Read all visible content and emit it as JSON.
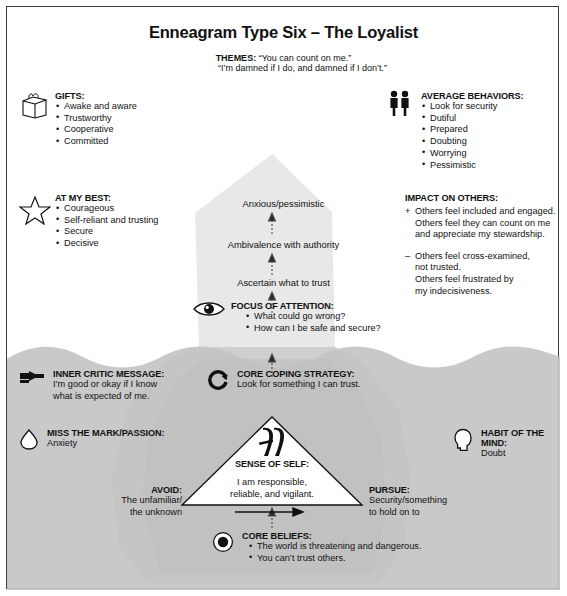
{
  "title": "Enneagram Type Six – The Loyalist",
  "themes": {
    "label": "THEMES:",
    "line1": "“You can count on me.”",
    "line2": "“I’m damned if I do, and damned if I don’t.”"
  },
  "gifts": {
    "icon": "gift-box-icon",
    "heading": "GIFTS:",
    "items": [
      "Awake and aware",
      "Trustworthy",
      "Cooperative",
      "Committed"
    ]
  },
  "at_my_best": {
    "icon": "star-icon",
    "heading": "AT MY BEST:",
    "items": [
      "Courageous",
      "Self-reliant and trusting",
      "Secure",
      "Decisive"
    ]
  },
  "average_behaviors": {
    "icon": "two-people-icon",
    "heading": "AVERAGE BEHAVIORS:",
    "items": [
      "Look for security",
      "Dutiful",
      "Prepared",
      "Doubting",
      "Worrying",
      "Pessimistic"
    ]
  },
  "impact_on_others": {
    "heading": "IMPACT ON OTHERS:",
    "positive": {
      "sign": "+",
      "lines": [
        "Others feel included and engaged.",
        "Others feel they can count on me",
        "and appreciate my stewardship."
      ]
    },
    "negative": {
      "sign": "–",
      "lines": [
        "Others feel cross-examined,",
        "not trusted.",
        "Others feel frustrated by",
        "my indecisiveness."
      ]
    }
  },
  "berg_levels": [
    "Anxious/pessimistic",
    "Ambivalence with authority",
    "Ascertain what to trust"
  ],
  "focus_of_attention": {
    "icon": "eye-icon",
    "heading": "FOCUS OF ATTENTION:",
    "items": [
      "What could go wrong?",
      "How can I be safe and secure?"
    ]
  },
  "inner_critic": {
    "icon": "pointing-hand-icon",
    "heading": "INNER CRITIC MESSAGE:",
    "lines": [
      "I’m good or okay if I know",
      "what is expected of me."
    ]
  },
  "core_coping": {
    "icon": "circular-arrow-icon",
    "heading": "CORE COPING STRATEGY:",
    "line": "Look for something I can trust."
  },
  "miss_the_mark": {
    "icon": "teardrop-icon",
    "heading": "MISS THE MARK/PASSION:",
    "line": "Anxiety"
  },
  "habit_of_mind": {
    "icon": "head-profile-icon",
    "heading": "HABIT OF THE MIND:",
    "line": "Doubt"
  },
  "sense_of_self": {
    "icon": "enneagram-six-glyph",
    "heading": "SENSE OF SELF:",
    "line1": "I am responsible,",
    "line2": "reliable, and vigilant."
  },
  "avoid": {
    "heading": "AVOID:",
    "line1": "The unfamiliar/",
    "line2": "the unknown"
  },
  "pursue": {
    "heading": "PURSUE:",
    "line1": "Security/something",
    "line2": "to hold on to"
  },
  "core_beliefs": {
    "icon": "target-dot-icon",
    "heading": "CORE BELIEFS:",
    "items": [
      "The world is threatening and dangerous.",
      "You can’t trust others."
    ]
  },
  "colors": {
    "ink": "#111111",
    "berg_above_water": "#e6e6e6",
    "berg_below_water": "#c9c9c9",
    "water": "#bdbdbd",
    "frame": "#3a3a3a"
  }
}
